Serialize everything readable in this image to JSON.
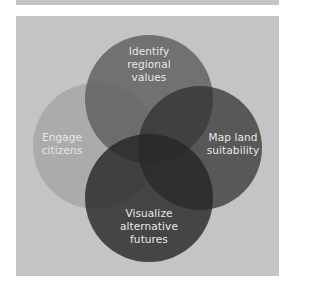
{
  "diagram": {
    "type": "venn",
    "background_color": "#c4c4c4",
    "label_color": "#e8e8e8",
    "circles": [
      {
        "id": "engage",
        "lines": [
          "Engage",
          "citizens"
        ],
        "fill": "#a8a8a8",
        "position": "left"
      },
      {
        "id": "identify",
        "lines": [
          "Identify",
          "regional",
          "values"
        ],
        "fill": "#6e6e6e",
        "position": "top"
      },
      {
        "id": "map",
        "lines": [
          "Map land",
          "suitability"
        ],
        "fill": "#4e4e4e",
        "position": "right"
      },
      {
        "id": "visualize",
        "lines": [
          "Visualize",
          "alternative",
          "futures"
        ],
        "fill": "#424242",
        "position": "bottom"
      }
    ]
  }
}
